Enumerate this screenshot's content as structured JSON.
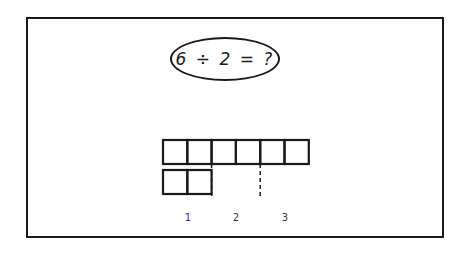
{
  "problem": {
    "equation": "6 ÷ 2 = ?"
  },
  "model": {
    "total_units": 6,
    "group_size": 2,
    "group_count_shown": 3,
    "group_labels": [
      "1",
      "2",
      "3"
    ]
  },
  "colors": {
    "ink": "#1a1a1a",
    "background": "#ffffff"
  }
}
